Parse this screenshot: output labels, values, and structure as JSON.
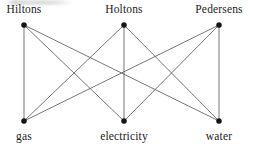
{
  "figure": {
    "type": "bipartite-graph",
    "canvas": {
      "width": 254,
      "height": 150
    },
    "edge_color": "#4a4a4a",
    "vertex_color": "#141414",
    "background_color": "#ffffff"
  },
  "nodes": {
    "top": [
      {
        "id": "hiltons",
        "label": "Hiltons",
        "x": 24,
        "y": 25
      },
      {
        "id": "holtons",
        "label": "Holtons",
        "x": 124,
        "y": 25
      },
      {
        "id": "pedersens",
        "label": "Pedersens",
        "x": 219,
        "y": 25
      }
    ],
    "bottom": [
      {
        "id": "gas",
        "label": "gas",
        "x": 24,
        "y": 121
      },
      {
        "id": "electricity",
        "label": "electricity",
        "x": 124,
        "y": 121
      },
      {
        "id": "water",
        "label": "water",
        "x": 219,
        "y": 121
      }
    ]
  },
  "edges": [
    {
      "from": "hiltons",
      "to": "gas"
    },
    {
      "from": "hiltons",
      "to": "electricity"
    },
    {
      "from": "hiltons",
      "to": "water"
    },
    {
      "from": "holtons",
      "to": "gas"
    },
    {
      "from": "holtons",
      "to": "electricity"
    },
    {
      "from": "holtons",
      "to": "water"
    },
    {
      "from": "pedersens",
      "to": "gas"
    },
    {
      "from": "pedersens",
      "to": "electricity"
    },
    {
      "from": "pedersens",
      "to": "water"
    }
  ]
}
